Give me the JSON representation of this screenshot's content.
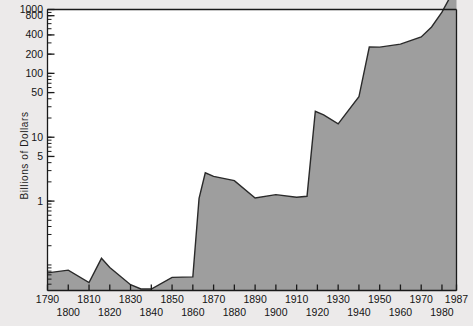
{
  "chart_data": {
    "type": "area",
    "title": "",
    "xlabel": "",
    "ylabel": "Billions of Dollars",
    "yscale": "log",
    "ylim": [
      0.04,
      1000
    ],
    "xlim": [
      1790,
      1987
    ],
    "grid": false,
    "legend": null,
    "y_tick_labels": [
      "1000",
      "800",
      "400",
      "200",
      "100",
      "50",
      "10",
      "5",
      "1"
    ],
    "y_tick_values": [
      1000,
      800,
      400,
      200,
      100,
      50,
      10,
      5,
      1
    ],
    "x_tick_labels_upper": [
      "1790",
      "1810",
      "1830",
      "1850",
      "1870",
      "1890",
      "1910",
      "1930",
      "1950",
      "1970",
      "1987"
    ],
    "x_tick_labels_lower": [
      "1800",
      "1820",
      "1840",
      "1860",
      "1880",
      "1900",
      "1920",
      "1940",
      "1960",
      "1980"
    ],
    "x_tick_values": [
      1790,
      1800,
      1810,
      1820,
      1830,
      1840,
      1850,
      1860,
      1870,
      1880,
      1890,
      1900,
      1910,
      1920,
      1930,
      1940,
      1950,
      1960,
      1970,
      1980,
      1987
    ],
    "series_name": "U.S. National Debt",
    "x": [
      1790,
      1800,
      1810,
      1816,
      1820,
      1830,
      1835,
      1840,
      1850,
      1860,
      1863,
      1866,
      1870,
      1880,
      1890,
      1900,
      1910,
      1915,
      1919,
      1923,
      1930,
      1940,
      1945,
      1950,
      1960,
      1970,
      1975,
      1980,
      1985,
      1987
    ],
    "y": [
      0.075,
      0.083,
      0.053,
      0.127,
      0.091,
      0.049,
      4e-05,
      0.005,
      0.064,
      0.065,
      1.1,
      2.77,
      2.44,
      2.09,
      1.12,
      1.26,
      1.15,
      1.19,
      25.5,
      22.3,
      16.2,
      43.0,
      258.7,
      257.4,
      286.3,
      370.9,
      533.2,
      907.7,
      1823.1,
      2350.3
    ],
    "fill_color": "#9e9e9e",
    "line_color": "#2a2a2a",
    "background_color": "#eceaea",
    "plot_background_color": "#ffffff"
  },
  "annotations": {
    "civil_war_peak_year": "1866",
    "wwi_peak_year": "1919",
    "final_year": "1987"
  }
}
